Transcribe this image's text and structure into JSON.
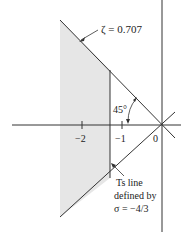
{
  "diagram": {
    "type": "s-plane region plot",
    "labels": {
      "zeta": "ζ = 0.707",
      "angle": "45°",
      "tick_minus2": "−2",
      "tick_minus1": "−1",
      "origin": "0",
      "ts_line_1": "Ts line",
      "ts_line_2": "defined by",
      "ts_line_3": "σ = −4/3"
    },
    "colors": {
      "shaded_region": "#e6e6e6",
      "line": "#333333"
    }
  }
}
